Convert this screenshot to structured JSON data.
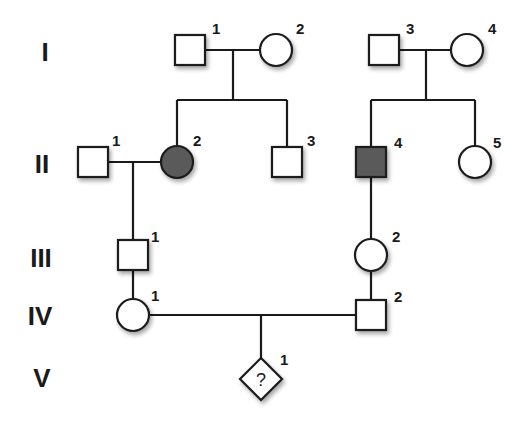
{
  "diagram": {
    "type": "pedigree",
    "colors": {
      "line": "#1a1a1a",
      "affected_fill": "#5a5a5a",
      "unaffected_fill": "#ffffff",
      "background": "#ffffff"
    },
    "generations": [
      {
        "label": "I",
        "y": 50
      },
      {
        "label": "II",
        "y": 162
      },
      {
        "label": "III",
        "y": 255
      },
      {
        "label": "IV",
        "y": 315
      },
      {
        "label": "V",
        "y": 378
      }
    ],
    "individuals": [
      {
        "id": "I-1",
        "number": "1",
        "sex": "male",
        "affected": false,
        "x": 190,
        "y": 50
      },
      {
        "id": "I-2",
        "number": "2",
        "sex": "female",
        "affected": false,
        "x": 276,
        "y": 50
      },
      {
        "id": "I-3",
        "number": "3",
        "sex": "male",
        "affected": false,
        "x": 384,
        "y": 50
      },
      {
        "id": "I-4",
        "number": "4",
        "sex": "female",
        "affected": false,
        "x": 467,
        "y": 50
      },
      {
        "id": "II-1",
        "number": "1",
        "sex": "male",
        "affected": false,
        "x": 93,
        "y": 162
      },
      {
        "id": "II-2",
        "number": "2",
        "sex": "female",
        "affected": true,
        "x": 177,
        "y": 162
      },
      {
        "id": "II-3",
        "number": "3",
        "sex": "male",
        "affected": false,
        "x": 287,
        "y": 162
      },
      {
        "id": "II-4",
        "number": "4",
        "sex": "male",
        "affected": true,
        "x": 371,
        "y": 162
      },
      {
        "id": "II-5",
        "number": "5",
        "sex": "female",
        "affected": false,
        "x": 475,
        "y": 162
      },
      {
        "id": "III-1",
        "number": "1",
        "sex": "male",
        "affected": false,
        "x": 133,
        "y": 255
      },
      {
        "id": "III-2",
        "number": "2",
        "sex": "female",
        "affected": false,
        "x": 371,
        "y": 255
      },
      {
        "id": "IV-1",
        "number": "1",
        "sex": "female",
        "affected": false,
        "x": 133,
        "y": 315
      },
      {
        "id": "IV-2",
        "number": "2",
        "sex": "male",
        "affected": false,
        "x": 371,
        "y": 315
      },
      {
        "id": "V-1",
        "number": "1",
        "sex": "unknown",
        "affected": false,
        "x": 261,
        "y": 378,
        "symbol_text": "?"
      }
    ],
    "unions": [
      {
        "partners": [
          "I-1",
          "I-2"
        ],
        "children": [
          "II-2",
          "II-3"
        ]
      },
      {
        "partners": [
          "I-3",
          "I-4"
        ],
        "children": [
          "II-4",
          "II-5"
        ]
      },
      {
        "partners": [
          "II-1",
          "II-2"
        ],
        "children": [
          "III-1"
        ]
      },
      {
        "partners": [
          "II-4"
        ],
        "children": [
          "III-2"
        ]
      },
      {
        "partners": [
          "IV-1",
          "IV-2"
        ],
        "children": [
          "V-1"
        ]
      }
    ]
  }
}
